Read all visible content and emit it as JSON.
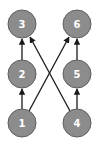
{
  "diagram": {
    "type": "directed-graph",
    "colors": {
      "node_fill": "#8c8c8c",
      "node_stroke": "#5e5e5e",
      "label": "#ffffff",
      "edge": "#1a1a1a"
    },
    "nodes": [
      {
        "id": "1",
        "label": "1",
        "x": 22,
        "y": 123
      },
      {
        "id": "2",
        "label": "2",
        "x": 22,
        "y": 74
      },
      {
        "id": "3",
        "label": "3",
        "x": 22,
        "y": 24
      },
      {
        "id": "4",
        "label": "4",
        "x": 77,
        "y": 123
      },
      {
        "id": "5",
        "label": "5",
        "x": 77,
        "y": 74
      },
      {
        "id": "6",
        "label": "6",
        "x": 77,
        "y": 24
      }
    ],
    "edges": [
      {
        "from": "1",
        "to": "2"
      },
      {
        "from": "2",
        "to": "3"
      },
      {
        "from": "4",
        "to": "5"
      },
      {
        "from": "5",
        "to": "6"
      },
      {
        "from": "1",
        "to": "6"
      },
      {
        "from": "4",
        "to": "3"
      }
    ]
  }
}
